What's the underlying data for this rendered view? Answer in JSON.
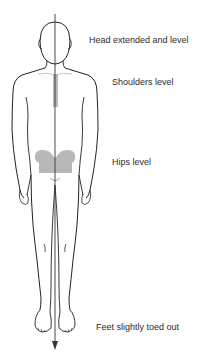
{
  "diagram": {
    "type": "posture-alignment-anterior-view",
    "colors": {
      "outline": "#222222",
      "plumb_line": "#333333",
      "highlight": "#b8b8b8",
      "label": "#2a2a2a"
    },
    "labels": [
      {
        "id": "head",
        "text": "Head extended and level"
      },
      {
        "id": "shoulders",
        "text": "Shoulders level"
      },
      {
        "id": "hips",
        "text": "Hips level"
      },
      {
        "id": "feet",
        "text": "Feet slightly toed out"
      }
    ]
  }
}
